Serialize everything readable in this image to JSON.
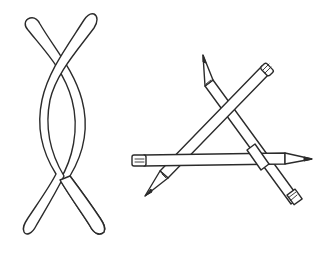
{
  "illustration": {
    "description": "Line drawing of two interwoven curved bands and three pencils forming an impossible triangle",
    "figures": [
      {
        "name": "twisted-band",
        "kind": "interwoven curved strips"
      },
      {
        "name": "pencil-triangle",
        "kind": "three pencils crossing",
        "pencil_count": 3
      }
    ],
    "colors": {
      "ink": "#2b2b2b",
      "paper": "#ffffff"
    }
  }
}
